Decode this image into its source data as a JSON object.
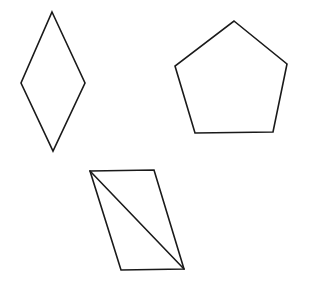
{
  "figure": {
    "background_color": "#ffffff",
    "stroke_color": "#1a1a1a",
    "stroke_width": 1.6,
    "width": 317,
    "height": 286,
    "shapes": [
      {
        "id": "rhombus",
        "name": "rhombus",
        "sides": 4,
        "points": "52,12 85,83 53,151 21,83",
        "fill": "#ffffff"
      },
      {
        "id": "pentagon",
        "name": "pentagon",
        "sides": 5,
        "points": "234,21 287,64 273,132 195,133 175,66",
        "fill": "#ffffff"
      },
      {
        "id": "parallelogram",
        "name": "parallelogram",
        "sides": 4,
        "points": "90,171 154,170 184,269 121,270",
        "fill": "#ffffff",
        "diagonal": {
          "name": "diagonal-line",
          "x1": 90,
          "y1": 171,
          "x2": 184,
          "y2": 269
        }
      }
    ]
  }
}
